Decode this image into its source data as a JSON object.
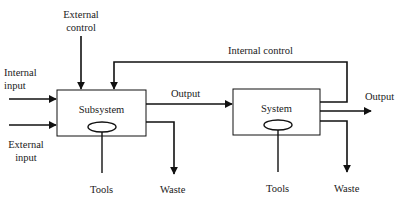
{
  "diagram": {
    "type": "system-block-diagram",
    "blocks": [
      {
        "id": "subsystem",
        "label": "Subsystem"
      },
      {
        "id": "system",
        "label": "System"
      }
    ],
    "labels": {
      "external_control": [
        "External",
        "control"
      ],
      "internal_control": "Internal control",
      "internal_input": [
        "Internal",
        "input"
      ],
      "external_input": [
        "External",
        "input"
      ],
      "output_middle": "Output",
      "output_right": "Output",
      "tools_left": "Tools",
      "tools_right": "Tools",
      "waste_left": "Waste",
      "waste_right": "Waste"
    },
    "edges": [
      {
        "from": "external control",
        "to": "subsystem"
      },
      {
        "from": "internal input",
        "to": "subsystem"
      },
      {
        "from": "external input",
        "to": "subsystem"
      },
      {
        "from": "subsystem",
        "to": "system",
        "label": "Output"
      },
      {
        "from": "system",
        "to": "subsystem",
        "label": "Internal control"
      },
      {
        "from": "system",
        "to": "output",
        "label": "Output"
      },
      {
        "from": "subsystem",
        "to": "waste",
        "label": "Waste"
      },
      {
        "from": "system",
        "to": "waste",
        "label": "Waste"
      },
      {
        "from": "tools",
        "to": "subsystem",
        "label": "Tools"
      },
      {
        "from": "tools",
        "to": "system",
        "label": "Tools"
      }
    ]
  }
}
